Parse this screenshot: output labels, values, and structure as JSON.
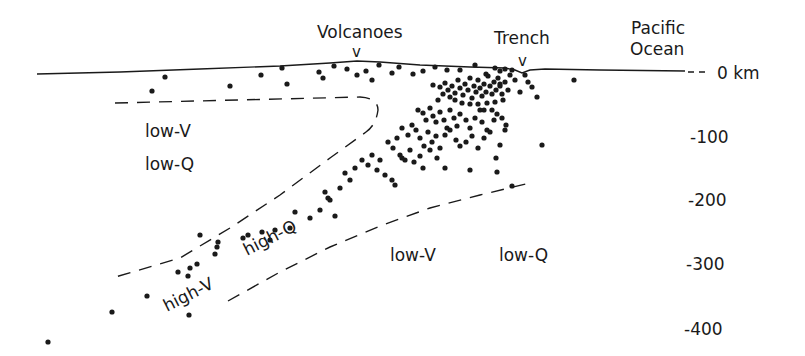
{
  "diagram": {
    "title_labels": {
      "volcanoes": "Volcanoes",
      "trench": "Trench",
      "ocean_line1": "Pacific",
      "ocean_line2": "Ocean",
      "volcano_marker": "v",
      "trench_marker": "v"
    },
    "depth_axis": {
      "unit_label": "0 km",
      "ticks": [
        {
          "label": "0 km",
          "depth_km": 0
        },
        {
          "label": "-100",
          "depth_km": 100
        },
        {
          "label": "-200",
          "depth_km": 200
        },
        {
          "label": "-300",
          "depth_km": 300
        },
        {
          "label": "-400",
          "depth_km": 400
        }
      ]
    },
    "regions": {
      "wedge_v": "low-V",
      "wedge_q": "low-Q",
      "slab_v": "high-V",
      "slab_q": "high-Q",
      "mantle_v": "low-V",
      "mantle_q": "low-Q"
    },
    "colors": {
      "ink": "#1a1a1a",
      "background": "#ffffff"
    },
    "earthquakes": [
      [
        152,
        91
      ],
      [
        165,
        77
      ],
      [
        230,
        86
      ],
      [
        261,
        75
      ],
      [
        282,
        68
      ],
      [
        287,
        84
      ],
      [
        319,
        72
      ],
      [
        323,
        78
      ],
      [
        334,
        66
      ],
      [
        347,
        69
      ],
      [
        357,
        75
      ],
      [
        366,
        71
      ],
      [
        372,
        80
      ],
      [
        379,
        65
      ],
      [
        392,
        73
      ],
      [
        399,
        67
      ],
      [
        413,
        74
      ],
      [
        423,
        71
      ],
      [
        435,
        67
      ],
      [
        447,
        70
      ],
      [
        460,
        70
      ],
      [
        475,
        65
      ],
      [
        486,
        74
      ],
      [
        495,
        68
      ],
      [
        500,
        71
      ],
      [
        505,
        69
      ],
      [
        512,
        70
      ],
      [
        433,
        85
      ],
      [
        440,
        87
      ],
      [
        445,
        83
      ],
      [
        448,
        90
      ],
      [
        452,
        86
      ],
      [
        455,
        93
      ],
      [
        458,
        80
      ],
      [
        460,
        88
      ],
      [
        463,
        95
      ],
      [
        465,
        84
      ],
      [
        468,
        90
      ],
      [
        470,
        78
      ],
      [
        472,
        98
      ],
      [
        474,
        86
      ],
      [
        476,
        92
      ],
      [
        478,
        80
      ],
      [
        480,
        88
      ],
      [
        482,
        96
      ],
      [
        484,
        84
      ],
      [
        486,
        92
      ],
      [
        488,
        76
      ],
      [
        490,
        86
      ],
      [
        492,
        94
      ],
      [
        494,
        82
      ],
      [
        496,
        90
      ],
      [
        498,
        78
      ],
      [
        500,
        86
      ],
      [
        502,
        94
      ],
      [
        505,
        82
      ],
      [
        508,
        90
      ],
      [
        510,
        75
      ],
      [
        455,
        100
      ],
      [
        462,
        103
      ],
      [
        470,
        104
      ],
      [
        478,
        104
      ],
      [
        487,
        103
      ],
      [
        495,
        102
      ],
      [
        503,
        100
      ],
      [
        450,
        97
      ],
      [
        443,
        94
      ],
      [
        438,
        100
      ],
      [
        484,
        110
      ],
      [
        492,
        110
      ],
      [
        500,
        84
      ],
      [
        515,
        80
      ],
      [
        520,
        92
      ],
      [
        528,
        82
      ],
      [
        525,
        75
      ],
      [
        532,
        87
      ],
      [
        537,
        97
      ],
      [
        542,
        145
      ],
      [
        574,
        80
      ],
      [
        418,
        110
      ],
      [
        423,
        113
      ],
      [
        426,
        120
      ],
      [
        430,
        108
      ],
      [
        433,
        116
      ],
      [
        436,
        122
      ],
      [
        440,
        112
      ],
      [
        444,
        120
      ],
      [
        447,
        128
      ],
      [
        450,
        110
      ],
      [
        454,
        118
      ],
      [
        457,
        126
      ],
      [
        460,
        114
      ],
      [
        466,
        120
      ],
      [
        470,
        128
      ],
      [
        475,
        118
      ],
      [
        480,
        110
      ],
      [
        482,
        122
      ],
      [
        487,
        130
      ],
      [
        494,
        120
      ],
      [
        497,
        114
      ],
      [
        502,
        118
      ],
      [
        506,
        125
      ],
      [
        402,
        128
      ],
      [
        408,
        135
      ],
      [
        412,
        125
      ],
      [
        416,
        130
      ],
      [
        420,
        138
      ],
      [
        424,
        146
      ],
      [
        428,
        132
      ],
      [
        432,
        142
      ],
      [
        436,
        136
      ],
      [
        440,
        148
      ],
      [
        445,
        135
      ],
      [
        450,
        130
      ],
      [
        456,
        140
      ],
      [
        460,
        146
      ],
      [
        466,
        142
      ],
      [
        472,
        136
      ],
      [
        478,
        148
      ],
      [
        484,
        138
      ],
      [
        490,
        132
      ],
      [
        496,
        158
      ],
      [
        500,
        145
      ],
      [
        505,
        130
      ],
      [
        388,
        142
      ],
      [
        393,
        148
      ],
      [
        397,
        138
      ],
      [
        400,
        155
      ],
      [
        405,
        160
      ],
      [
        410,
        150
      ],
      [
        414,
        162
      ],
      [
        420,
        156
      ],
      [
        423,
        168
      ],
      [
        430,
        150
      ],
      [
        437,
        158
      ],
      [
        445,
        168
      ],
      [
        362,
        160
      ],
      [
        368,
        165
      ],
      [
        372,
        155
      ],
      [
        377,
        170
      ],
      [
        380,
        160
      ],
      [
        385,
        175
      ],
      [
        392,
        180
      ],
      [
        395,
        185
      ],
      [
        402,
        158
      ],
      [
        470,
        170
      ],
      [
        497,
        172
      ],
      [
        512,
        186
      ],
      [
        345,
        173
      ],
      [
        350,
        180
      ],
      [
        355,
        168
      ],
      [
        340,
        188
      ],
      [
        325,
        192
      ],
      [
        328,
        198
      ],
      [
        320,
        210
      ],
      [
        330,
        200
      ],
      [
        335,
        216
      ],
      [
        310,
        218
      ],
      [
        295,
        212
      ],
      [
        290,
        228
      ],
      [
        275,
        230
      ],
      [
        270,
        240
      ],
      [
        262,
        232
      ],
      [
        248,
        235
      ],
      [
        243,
        238
      ],
      [
        218,
        242
      ],
      [
        217,
        247
      ],
      [
        215,
        254
      ],
      [
        200,
        235
      ],
      [
        197,
        264
      ],
      [
        190,
        268
      ],
      [
        178,
        272
      ],
      [
        188,
        276
      ],
      [
        147,
        296
      ],
      [
        112,
        312
      ],
      [
        189,
        315
      ],
      [
        48,
        342
      ]
    ]
  }
}
